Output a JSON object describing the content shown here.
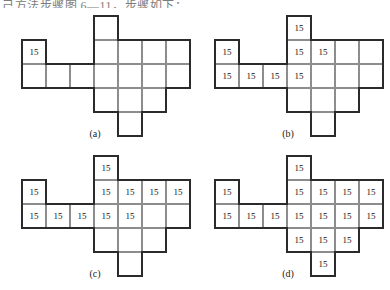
{
  "page": {
    "top_text": "己方法步骤图 6—11，步骤如下：",
    "cell_value": "15",
    "grid": {
      "cols": 7,
      "rows": 5,
      "cell_px": 24
    },
    "colors": {
      "outline": "#2b2b2b",
      "gridline": "#8d8d8d",
      "paper": "#ffffff",
      "text": "#111111"
    }
  },
  "figures": [
    {
      "id": "a",
      "caption": "(a)",
      "shape_cells": [
        [
          0,
          1
        ],
        [
          0,
          2
        ],
        [
          1,
          2
        ],
        [
          2,
          2
        ],
        [
          3,
          0
        ],
        [
          3,
          1
        ],
        [
          3,
          2
        ],
        [
          3,
          3
        ],
        [
          4,
          1
        ],
        [
          4,
          2
        ],
        [
          4,
          3
        ],
        [
          4,
          4
        ],
        [
          5,
          1
        ],
        [
          5,
          2
        ],
        [
          5,
          3
        ],
        [
          6,
          1
        ],
        [
          6,
          2
        ]
      ],
      "filled_cells": [
        [
          0,
          1
        ]
      ],
      "filled_count": 1
    },
    {
      "id": "b",
      "caption": "(b)",
      "shape_cells": [
        [
          0,
          1
        ],
        [
          0,
          2
        ],
        [
          1,
          2
        ],
        [
          2,
          2
        ],
        [
          3,
          0
        ],
        [
          3,
          1
        ],
        [
          3,
          2
        ],
        [
          3,
          3
        ],
        [
          4,
          1
        ],
        [
          4,
          2
        ],
        [
          4,
          3
        ],
        [
          4,
          4
        ],
        [
          5,
          1
        ],
        [
          5,
          2
        ],
        [
          5,
          3
        ],
        [
          6,
          1
        ],
        [
          6,
          2
        ]
      ],
      "filled_cells": [
        [
          0,
          1
        ],
        [
          0,
          2
        ],
        [
          1,
          2
        ],
        [
          2,
          2
        ],
        [
          3,
          0
        ],
        [
          3,
          1
        ],
        [
          3,
          2
        ],
        [
          4,
          1
        ]
      ],
      "filled_count": 8
    },
    {
      "id": "c",
      "caption": "(c)",
      "shape_cells": [
        [
          0,
          1
        ],
        [
          0,
          2
        ],
        [
          1,
          2
        ],
        [
          2,
          2
        ],
        [
          3,
          0
        ],
        [
          3,
          1
        ],
        [
          3,
          2
        ],
        [
          3,
          3
        ],
        [
          4,
          1
        ],
        [
          4,
          2
        ],
        [
          4,
          3
        ],
        [
          4,
          4
        ],
        [
          5,
          1
        ],
        [
          5,
          2
        ],
        [
          5,
          3
        ],
        [
          6,
          1
        ],
        [
          6,
          2
        ]
      ],
      "filled_cells": [
        [
          0,
          1
        ],
        [
          0,
          2
        ],
        [
          1,
          2
        ],
        [
          2,
          2
        ],
        [
          3,
          0
        ],
        [
          3,
          1
        ],
        [
          3,
          2
        ],
        [
          4,
          1
        ],
        [
          4,
          2
        ],
        [
          5,
          1
        ],
        [
          6,
          1
        ]
      ],
      "filled_count": 11
    },
    {
      "id": "d",
      "caption": "(d)",
      "shape_cells": [
        [
          0,
          1
        ],
        [
          0,
          2
        ],
        [
          1,
          2
        ],
        [
          2,
          2
        ],
        [
          3,
          0
        ],
        [
          3,
          1
        ],
        [
          3,
          2
        ],
        [
          3,
          3
        ],
        [
          4,
          1
        ],
        [
          4,
          2
        ],
        [
          4,
          3
        ],
        [
          4,
          4
        ],
        [
          5,
          1
        ],
        [
          5,
          2
        ],
        [
          5,
          3
        ],
        [
          6,
          1
        ],
        [
          6,
          2
        ]
      ],
      "filled_cells": [
        [
          0,
          1
        ],
        [
          0,
          2
        ],
        [
          1,
          2
        ],
        [
          2,
          2
        ],
        [
          3,
          0
        ],
        [
          3,
          1
        ],
        [
          3,
          2
        ],
        [
          3,
          3
        ],
        [
          4,
          1
        ],
        [
          4,
          2
        ],
        [
          4,
          3
        ],
        [
          4,
          4
        ],
        [
          5,
          1
        ],
        [
          5,
          2
        ],
        [
          5,
          3
        ],
        [
          6,
          1
        ],
        [
          6,
          2
        ]
      ],
      "filled_count": 17
    }
  ],
  "figure_positions": [
    {
      "id": "a",
      "left": 22,
      "top": 16,
      "cap_left": 75,
      "cap_top": 128
    },
    {
      "id": "b",
      "left": 215,
      "top": 16,
      "cap_left": 268,
      "cap_top": 128
    },
    {
      "id": "c",
      "left": 22,
      "top": 156,
      "cap_left": 75,
      "cap_top": 268
    },
    {
      "id": "d",
      "left": 215,
      "top": 156,
      "cap_left": 268,
      "cap_top": 268
    }
  ]
}
